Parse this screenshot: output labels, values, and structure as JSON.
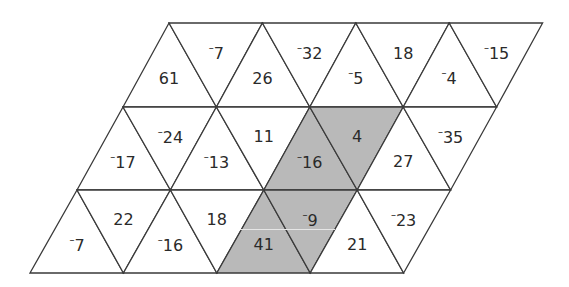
{
  "diagram": {
    "type": "triangle-grid-parallelogram",
    "rows": 3,
    "triangles_per_row": 8,
    "colors": {
      "shaded": "#b9b9b9",
      "unshaded": "#ffffff",
      "stroke": "#3a3a3a",
      "text": "#2a2a2a"
    },
    "row_y": [
      23,
      107,
      190,
      273
    ],
    "row_left_x": [
      169,
      123,
      77,
      30
    ],
    "step": 93.4,
    "cells": [
      [
        {
          "value": "61",
          "negative": false,
          "shaded": false
        },
        {
          "value": "7",
          "negative": true,
          "shaded": false
        },
        {
          "value": "26",
          "negative": false,
          "shaded": false
        },
        {
          "value": "32",
          "negative": true,
          "shaded": false
        },
        {
          "value": "5",
          "negative": true,
          "shaded": false
        },
        {
          "value": "18",
          "negative": false,
          "shaded": false
        },
        {
          "value": "4",
          "negative": true,
          "shaded": false
        },
        {
          "value": "15",
          "negative": true,
          "shaded": false
        }
      ],
      [
        {
          "value": "17",
          "negative": true,
          "shaded": false
        },
        {
          "value": "24",
          "negative": true,
          "shaded": false
        },
        {
          "value": "13",
          "negative": true,
          "shaded": false
        },
        {
          "value": "11",
          "negative": false,
          "shaded": false
        },
        {
          "value": "16",
          "negative": true,
          "shaded": true
        },
        {
          "value": "4",
          "negative": false,
          "shaded": true
        },
        {
          "value": "27",
          "negative": false,
          "shaded": false
        },
        {
          "value": "35",
          "negative": true,
          "shaded": false
        }
      ],
      [
        {
          "value": "7",
          "negative": true,
          "shaded": false
        },
        {
          "value": "22",
          "negative": false,
          "shaded": false
        },
        {
          "value": "16",
          "negative": true,
          "shaded": false
        },
        {
          "value": "18",
          "negative": false,
          "shaded": false
        },
        {
          "value": "41",
          "negative": false,
          "shaded": true
        },
        {
          "value": "9",
          "negative": true,
          "shaded": true
        },
        {
          "value": "21",
          "negative": false,
          "shaded": false
        },
        {
          "value": "23",
          "negative": true,
          "shaded": false
        }
      ]
    ],
    "negative_sign": "⁻"
  }
}
